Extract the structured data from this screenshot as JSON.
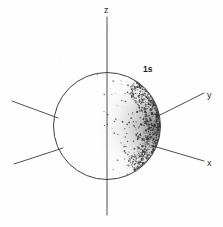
{
  "figure": {
    "name": "1s atomic orbital electron-density diagram",
    "background_color": "#ffffff",
    "ink_color": "#303030",
    "width": 223,
    "height": 227
  },
  "orbital": {
    "label": "1s",
    "label_x": 148,
    "label_y": 71,
    "shape": "sphere",
    "center_x": 107,
    "center_y": 126,
    "radius": 54,
    "outline_color": "#40403f",
    "shading_style": "stipple",
    "shading_side": "right",
    "shading_note": "electron probability density shown as dots, densest near right rim"
  },
  "axes": [
    {
      "id": "z",
      "label": "z",
      "label_x": 104,
      "label_y": 13,
      "x1": 107,
      "y1": 17,
      "x2": 107,
      "y2": 215,
      "orientation": "vertical"
    },
    {
      "id": "y",
      "label": "y",
      "label_x": 207,
      "label_y": 98,
      "x1": 12,
      "y1": 101,
      "x2": 204,
      "y2": 93,
      "orientation": "oblique-up-right"
    },
    {
      "id": "x",
      "label": "x",
      "label_x": 207,
      "label_y": 166,
      "x1": 14,
      "y1": 164,
      "x2": 204,
      "y2": 161,
      "orientation": "oblique-down-right"
    }
  ],
  "axis_labels": {
    "z": "z",
    "y": "y",
    "x": "x"
  },
  "chart_data": {
    "type": "scatter",
    "title": "1s",
    "xlabel": "y",
    "ylabel": "z",
    "zlabel": "x",
    "legend": [
      "1s"
    ]
  }
}
